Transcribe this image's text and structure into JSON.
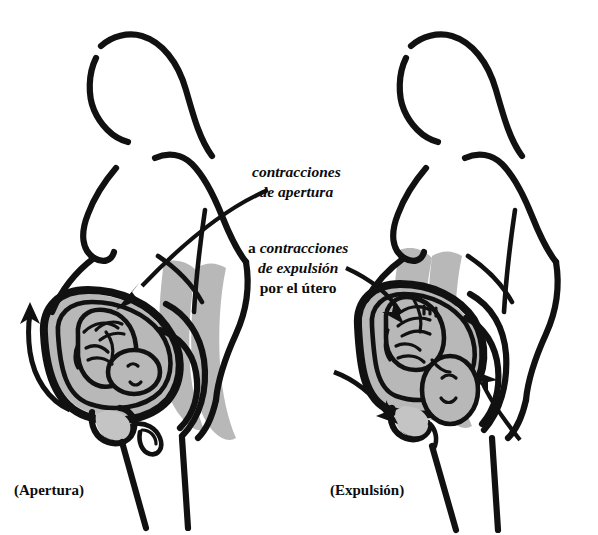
{
  "figure": {
    "title_fragment": "",
    "language": "es",
    "background_color": "#ffffff",
    "ink_color": "#111111",
    "organ_shade_color": "#b8b8b8",
    "width": 598,
    "height": 535
  },
  "callouts": [
    {
      "id": "apertura",
      "line1_lead": "",
      "line1": "contracciones",
      "line2": "de apertura",
      "line3": "",
      "style": "italic-bold",
      "points_to": "uterus-left-figure"
    },
    {
      "id": "expulsion",
      "line1_lead": "a ",
      "line1": "contracciones",
      "line2": "de expulsión",
      "line3": "por el útero",
      "style": "italic-bold",
      "points_to": "uterus-right-figure"
    }
  ],
  "stages": [
    {
      "id": "left",
      "label": "(Apertura)",
      "arrow_direction": "upward",
      "description": "dilation stage"
    },
    {
      "id": "right",
      "label": "(Expulsión)",
      "arrow_direction": "downward",
      "description": "expulsion stage"
    }
  ]
}
